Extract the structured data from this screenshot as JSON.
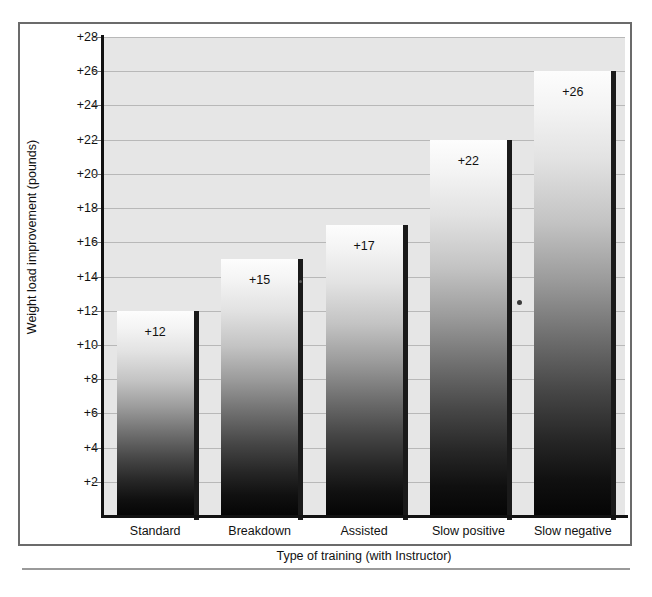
{
  "chart_data": {
    "type": "bar",
    "title": "",
    "subtitle": "",
    "xlabel": "Type of training (with Instructor)",
    "ylabel": "Weight load improvement (pounds)",
    "categories": [
      "Standard",
      "Breakdown",
      "Assisted",
      "Slow positive",
      "Slow negative"
    ],
    "values": [
      12,
      15,
      17,
      22,
      26
    ],
    "data_labels": [
      "+12",
      "+15",
      "+17",
      "+22",
      "+26"
    ],
    "ylim": [
      0,
      28
    ],
    "ytick_values": [
      2,
      4,
      6,
      8,
      10,
      12,
      14,
      16,
      18,
      20,
      22,
      24,
      26,
      28
    ],
    "ytick_labels": [
      "+2",
      "+4",
      "+6",
      "+8",
      "+10",
      "+12",
      "+14",
      "+16",
      "+18",
      "+20",
      "+22",
      "+24",
      "+26",
      "+28"
    ],
    "grid": true,
    "grid_orientation": "horizontal",
    "legend": false,
    "legend_position": "none",
    "bar_style": "vertical-grayscale-gradient",
    "colors": {
      "plot_background": "#e6e6e6",
      "gridline": "#b8b8b8",
      "axis_line": "#121212",
      "bar_gradient_top": "#fdfdfd",
      "bar_gradient_bottom": "#050505",
      "bar_shadow": "#1a1a1a",
      "text": "#111111",
      "frame_border": "#6b6b6b",
      "rule": "#9a9a9a"
    }
  },
  "axes": {
    "y_title": "Weight load improvement (pounds)",
    "x_title": "Type of training (with Instructor)"
  },
  "bars": [
    {
      "category": "Standard",
      "value": 12,
      "label": "+12"
    },
    {
      "category": "Breakdown",
      "value": 15,
      "label": "+15"
    },
    {
      "category": "Assisted",
      "value": 17,
      "label": "+17"
    },
    {
      "category": "Slow positive",
      "value": 22,
      "label": "+22"
    },
    {
      "category": "Slow negative",
      "value": 26,
      "label": "+26"
    }
  ]
}
